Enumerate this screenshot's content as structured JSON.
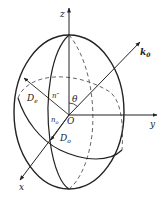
{
  "diagram": {
    "type": "index-ellipsoid",
    "axes": {
      "x": "x",
      "y": "y",
      "z": "z"
    },
    "origin": "O",
    "wave_vector": "k",
    "wave_vector_subscript": "0",
    "angle": "θ",
    "labels": {
      "De_main": "D",
      "De_sub": "e",
      "n_double_prime": "n″",
      "no_main": "n",
      "no_sub": "o",
      "Do_main": "D",
      "Do_sub": "o"
    },
    "colors": {
      "stroke": "#222222",
      "background": "#ffffff"
    }
  }
}
